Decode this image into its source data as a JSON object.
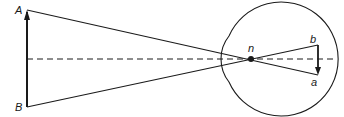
{
  "diagram": {
    "labels": {
      "object_top": "A",
      "object_bottom": "B",
      "nodal_point": "n",
      "image_top": "b",
      "image_bottom": "a"
    },
    "colors": {
      "stroke": "#1a1a1a",
      "background": "#ffffff"
    },
    "elements": {
      "object_arrow": "object A-B, arrow pointing up to A",
      "image_arrow": "inverted image b-a on retina, arrow pointing down to a",
      "optical_axis": "dashed horizontal axis",
      "eyeball": "eyeball outline with corneal bulge",
      "rays": "rays from A and B crossing at nodal point n"
    }
  }
}
